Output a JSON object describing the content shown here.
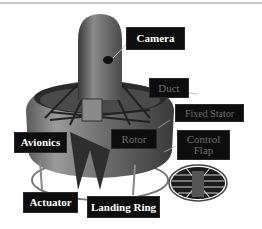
{
  "figure": {
    "labels": {
      "camera": "Camera",
      "duct": "Duct",
      "fixed_stator": "Fixed Stator",
      "control_flap": "Control Flap",
      "rotor": "Rotor",
      "avionics": "Avionics",
      "actuator": "Actuator",
      "landing_ring": "Landing Ring"
    },
    "small_part_text": {
      "payload_top": "Payload",
      "engine": "Engine",
      "payload_bottom": "Payload"
    }
  },
  "colors": {
    "label_bg": "#0d0d0d",
    "label_text": "#ffffff",
    "label_text_dim": "#6a6a6a",
    "body_gray": "#6e6e6e"
  }
}
